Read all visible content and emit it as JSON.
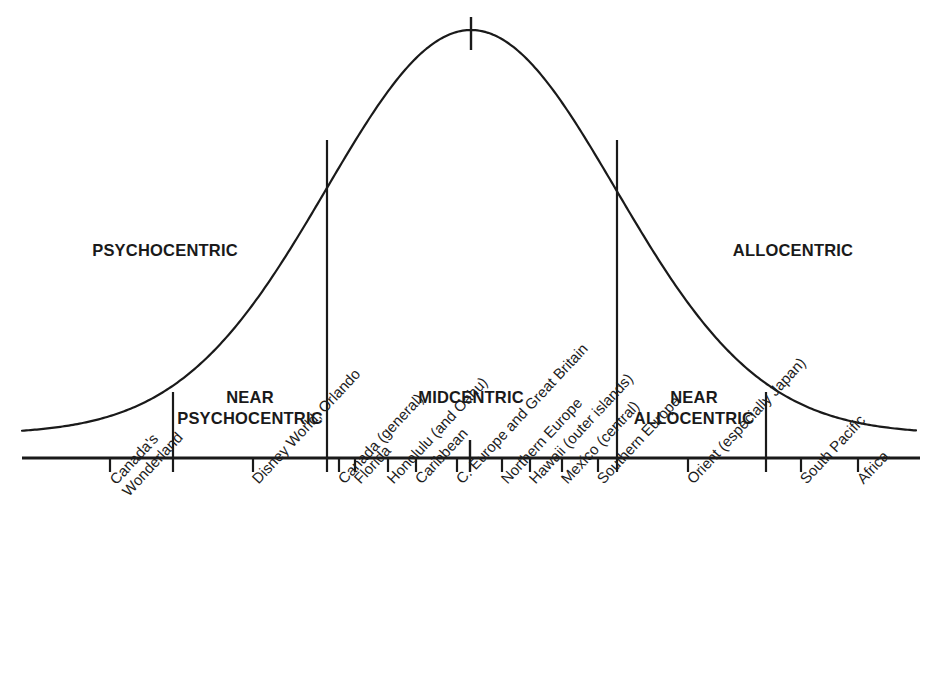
{
  "figure": {
    "background_color": "#ffffff",
    "line_color": "#1a1a1a"
  },
  "zones": [
    {
      "id": "psychocentric",
      "label": "PSYCHOCENTRIC",
      "x": 165,
      "y": 240
    },
    {
      "id": "near-psychocentric",
      "label_line1": "NEAR",
      "label_line2": "PSYCHOCENTRIC",
      "x": 250,
      "y": 387
    },
    {
      "id": "midcentric",
      "label": "MIDCENTRIC",
      "x": 471,
      "y": 387
    },
    {
      "id": "near-allocentric",
      "label_line1": "NEAR",
      "label_line2": "ALLOCENTRIC",
      "x": 694,
      "y": 387
    },
    {
      "id": "allocentric",
      "label": "ALLOCENTRIC",
      "x": 793,
      "y": 240
    }
  ],
  "axis": {
    "x_start": 22,
    "x_end": 920,
    "y": 458,
    "tick_length": 14
  },
  "dividers": [
    {
      "id": "psychocentric-near-psychocentric",
      "x": 173,
      "y_top": 392,
      "y_bottom": 458
    },
    {
      "id": "near-psychocentric-midcentric",
      "x": 327,
      "y_top": 140,
      "y_bottom": 458
    },
    {
      "id": "midcentric-near-allocentric",
      "x": 617,
      "y_top": 140,
      "y_bottom": 458
    },
    {
      "id": "near-allocentric-allocentric",
      "x": 766,
      "y_top": 392,
      "y_bottom": 458
    }
  ],
  "peak_marker": {
    "x": 471,
    "y_top": 17,
    "y_bottom": 50
  },
  "center_marker": {
    "x": 470,
    "y_top": 440,
    "y_bottom": 472
  },
  "chart_data": {
    "type": "line",
    "xlabel": "Destinations ordered from psychocentric to allocentric",
    "ylabel": "Number of travelers (relative frequency)",
    "grid": false,
    "legend": null,
    "curve": "normal distribution (bell curve)",
    "curve_peak_x_px": 471,
    "curve_peak_y_px": 30,
    "curve_baseline_y_px": 434,
    "xlim_px": [
      22,
      916
    ],
    "zone_boundaries_px": [
      173,
      327,
      617,
      766
    ],
    "zones": [
      "PSYCHOCENTRIC",
      "NEAR PSYCHOCENTRIC",
      "MIDCENTRIC",
      "NEAR ALLOCENTRIC",
      "ALLOCENTRIC"
    ],
    "categories": [
      "Canada's Wonderland",
      "Disney World, Orlando",
      "Canada (general)",
      "Florida",
      "Honolulu (and Oahu)",
      "Caribbean",
      "C. Europe and Great Britain",
      "Northern Europe",
      "Hawaii (outer islands)",
      "Mexico (central)",
      "Southern Europe",
      "Orient (especially Japan)",
      "South Pacific",
      "Africa"
    ],
    "tick_positions_px": [
      110,
      253,
      339,
      355,
      388,
      416,
      457,
      502,
      530,
      562,
      598,
      688,
      801,
      858
    ],
    "tick_zone": [
      "PSYCHOCENTRIC",
      "NEAR PSYCHOCENTRIC",
      "MIDCENTRIC",
      "MIDCENTRIC",
      "MIDCENTRIC",
      "MIDCENTRIC",
      "MIDCENTRIC",
      "MIDCENTRIC",
      "MIDCENTRIC",
      "MIDCENTRIC",
      "MIDCENTRIC",
      "NEAR ALLOCENTRIC",
      "ALLOCENTRIC",
      "ALLOCENTRIC"
    ]
  },
  "tick_labels": [
    {
      "text": "Canada's Wonderland",
      "line1": "Canada's",
      "line2": "Wonderland",
      "x": 110,
      "two_line": true
    },
    {
      "text": "Disney World, Orlando",
      "line1": "Disney World, Orlando",
      "line2": "",
      "x": 253,
      "two_line": false
    },
    {
      "text": "Canada (general)",
      "line1": "Canada (general)",
      "line2": "",
      "x": 339,
      "two_line": false
    },
    {
      "text": "Florida",
      "line1": "Florida",
      "line2": "",
      "x": 355,
      "two_line": false
    },
    {
      "text": "Honolulu (and Oahu)",
      "line1": "Honolulu (and Oahu)",
      "line2": "",
      "x": 388,
      "two_line": false
    },
    {
      "text": "Caribbean",
      "line1": "Caribbean",
      "line2": "",
      "x": 416,
      "two_line": false
    },
    {
      "text": "C. Europe and Great Britain",
      "line1": "C. Europe and Great Britain",
      "line2": "",
      "x": 457,
      "two_line": false
    },
    {
      "text": "Northern Europe",
      "line1": "Northern Europe",
      "line2": "",
      "x": 502,
      "two_line": false
    },
    {
      "text": "Hawaii (outer islands)",
      "line1": "Hawaii (outer islands)",
      "line2": "",
      "x": 530,
      "two_line": false
    },
    {
      "text": "Mexico (central)",
      "line1": "Mexico (central)",
      "line2": "",
      "x": 562,
      "two_line": false
    },
    {
      "text": "Southern Europe",
      "line1": "Southern Europe",
      "line2": "",
      "x": 598,
      "two_line": false
    },
    {
      "text": "Orient (especially Japan)",
      "line1": "Orient (especially Japan)",
      "line2": "",
      "x": 688,
      "two_line": false
    },
    {
      "text": "South Pacific",
      "line1": "South Pacific",
      "line2": "",
      "x": 801,
      "two_line": false
    },
    {
      "text": "Africa",
      "line1": "Africa",
      "line2": "",
      "x": 858,
      "two_line": false
    }
  ]
}
